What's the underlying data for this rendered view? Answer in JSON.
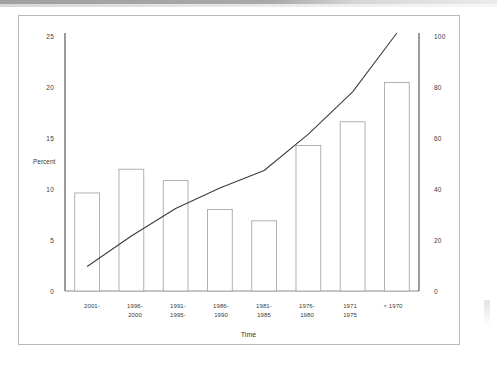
{
  "figure": {
    "axis_title_y_left": "Percent",
    "axis_title_x": "Time",
    "yticks_left": [
      "25",
      "20",
      "15",
      "10",
      "5",
      "0"
    ],
    "yticks_right": [
      "100",
      "80",
      "60",
      "40",
      "20",
      "0"
    ]
  },
  "chart_data": {
    "type": "bar",
    "title": "",
    "subtitle": "",
    "xlabel": "Time",
    "ylabel": "Percent",
    "y2label": "",
    "ylim": [
      0,
      25
    ],
    "y2lim": [
      0,
      100
    ],
    "grid": false,
    "legend": "none",
    "categories": [
      "2001-",
      "1996-\n2000",
      "1991-\n1995-",
      "1986-\n1990",
      "1981-\n1985",
      "1976-\n1980",
      "1971\n1975",
      "< 1970"
    ],
    "category_lines": [
      [
        "2001-",
        ""
      ],
      [
        "1996-",
        "2000"
      ],
      [
        "1991-",
        "1995-"
      ],
      [
        "1986-",
        "1990"
      ],
      [
        "1981-",
        "1985"
      ],
      [
        "1976-",
        "1980"
      ],
      [
        "1971",
        "1975"
      ],
      [
        "< 1970",
        ""
      ]
    ],
    "series": [
      {
        "name": "Percent",
        "type": "bar",
        "axis": "left",
        "values": [
          9.5,
          11.8,
          10.7,
          7.9,
          6.8,
          14.1,
          16.4,
          20.2
        ]
      },
      {
        "name": "Cumulative",
        "type": "line",
        "axis": "right",
        "values": [
          9.5,
          21.3,
          32.0,
          39.9,
          46.7,
          60.8,
          77.2,
          100.0
        ]
      }
    ],
    "yticks_left": [
      0,
      5,
      10,
      15,
      20,
      25
    ],
    "yticks_right": [
      0,
      20,
      40,
      60,
      80,
      100
    ]
  }
}
